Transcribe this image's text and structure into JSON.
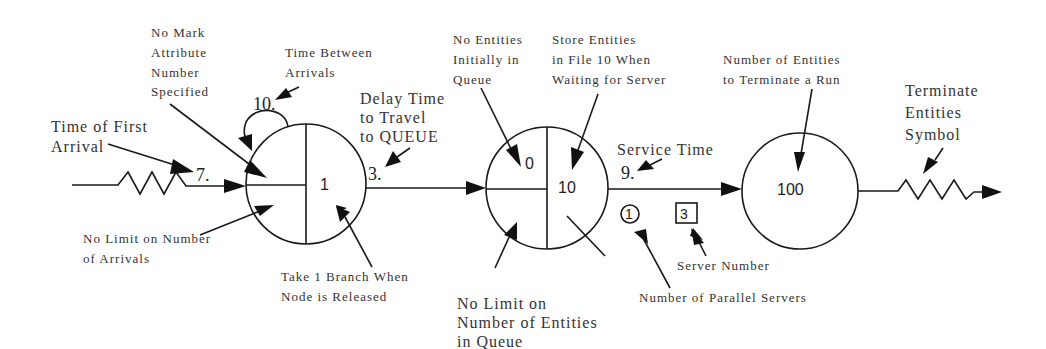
{
  "diagram": {
    "type": "SLAM network: CREATE - QUEUE - TERMINATE",
    "create_node": {
      "time_of_first_arrival": "7.",
      "time_between_arrivals": "10.",
      "branches": "1",
      "delay_time": "3.",
      "labels": {
        "time_of_first_arrival": [
          "Time of First",
          "Arrival"
        ],
        "no_mark_attribute": [
          "No Mark",
          "Attribute",
          "Number",
          "Specified"
        ],
        "time_between_arrivals": [
          "Time Between",
          "Arrivals"
        ],
        "delay_time": [
          "Delay Time",
          "to Travel",
          "to QUEUE"
        ],
        "no_limit_arrivals": [
          "No Limit on Number",
          "of Arrivals"
        ],
        "take_branch": [
          "Take 1 Branch When",
          "Node is Released"
        ]
      }
    },
    "queue_node": {
      "initial_entities": "0",
      "file_number": "10",
      "service_time": "9.",
      "parallel_servers": "1",
      "server_number": "3",
      "labels": {
        "no_entities_initially": [
          "No Entities",
          "Initially in",
          "Queue"
        ],
        "store_entities": [
          "Store Entities",
          "in File 10 When",
          "Waiting for Server"
        ],
        "service_time": "Service Time",
        "no_limit_queue": [
          "No Limit on",
          "Number of Entities",
          "in Queue"
        ],
        "parallel_servers": "Number of Parallel Servers",
        "server_number": "Server Number"
      }
    },
    "terminate_node": {
      "count": "100",
      "labels": {
        "terminate_count": [
          "Number of Entities",
          "to Terminate a Run"
        ],
        "terminate_symbol": [
          "Terminate",
          "Entities",
          "Symbol"
        ]
      }
    }
  }
}
